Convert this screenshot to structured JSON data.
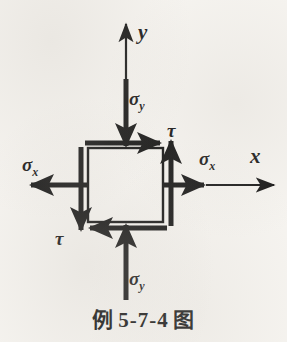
{
  "figure": {
    "caption": "例 5-7-4 图",
    "caption_prefix": "例",
    "caption_number": "5-7-4",
    "caption_suffix": "图",
    "background_color": "#f6f4f0",
    "ink_color": "#111111"
  },
  "axes": {
    "y_axis_label": "y",
    "x_axis_label": "x",
    "y_axis_name": "vertical-axis",
    "x_axis_name": "horizontal-axis"
  },
  "element": {
    "shape": "square",
    "outline_color": "#111111"
  },
  "stresses": {
    "sigma_symbol": "σ",
    "tau_symbol": "τ",
    "sub_x": "x",
    "sub_y": "y",
    "labels": [
      {
        "id": "sigma-y-top",
        "symbol": "σ",
        "subscript": "y",
        "direction": "down",
        "position": "top"
      },
      {
        "id": "sigma-y-bottom",
        "symbol": "σ",
        "subscript": "y",
        "direction": "up",
        "position": "bottom"
      },
      {
        "id": "sigma-x-left",
        "symbol": "σ",
        "subscript": "x",
        "direction": "left",
        "position": "left"
      },
      {
        "id": "sigma-x-right",
        "symbol": "σ",
        "subscript": "x",
        "direction": "right",
        "position": "right"
      },
      {
        "id": "tau-top-right",
        "symbol": "τ",
        "subscript": "",
        "direction": "right",
        "position": "top-edge"
      },
      {
        "id": "tau-bottom-left",
        "symbol": "τ",
        "subscript": "",
        "direction": "left",
        "position": "bottom-edge"
      }
    ]
  }
}
